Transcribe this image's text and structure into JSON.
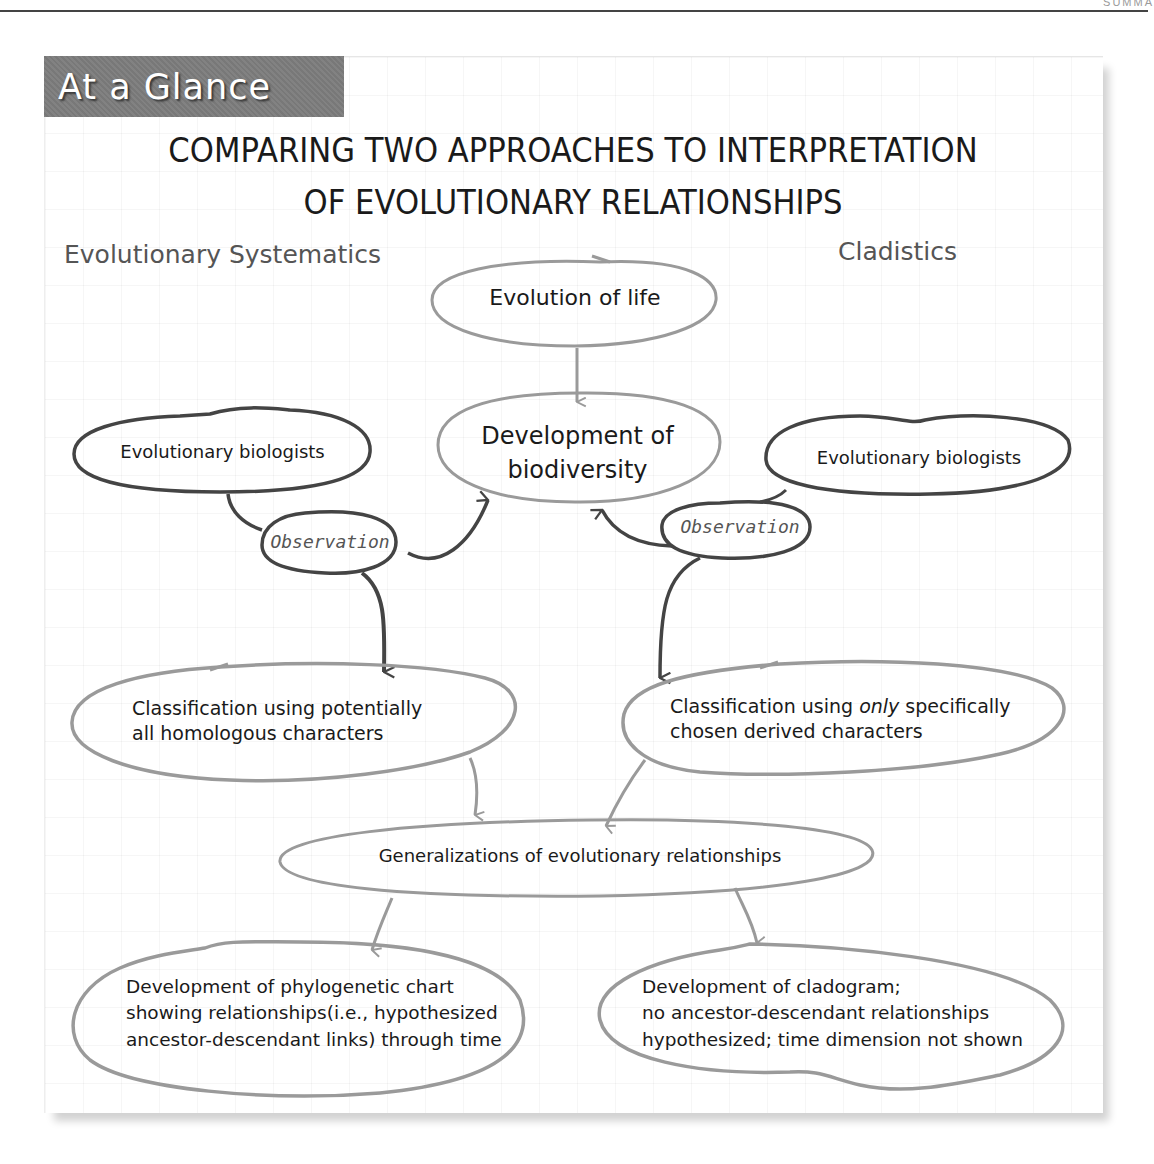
{
  "page": {
    "running_head": "SUMMA"
  },
  "badge": {
    "label": "At a Glance",
    "color": "#7d7d7d"
  },
  "title": {
    "line1": "COMPARING TWO APPROACHES TO INTERPRETATION",
    "line2": "OF EVOLUTIONARY RELATIONSHIPS"
  },
  "columns": {
    "left": "Evolutionary Systematics",
    "right": "Cladistics"
  },
  "nodes": {
    "evolution_of_life": "Evolution of life",
    "development_biodiversity": {
      "line1": "Development of",
      "line2": "biodiversity"
    },
    "biologists_left": "Evolutionary biologists",
    "biologists_right": "Evolutionary biologists",
    "observation_left": "Observation",
    "observation_right": "Observation",
    "classification_left": {
      "line1": "Classification using potentially",
      "line2": "all homologous characters"
    },
    "classification_right": {
      "line1_pre": "Classification using ",
      "line1_em": "only",
      "line1_post": " specifically",
      "line2": "chosen derived characters"
    },
    "generalizations": "Generalizations of evolutionary relationships",
    "phylogenetic_chart": {
      "line1": "Development of phylogenetic chart",
      "line2": "showing relationships(i.e., hypothesized",
      "line3": "ancestor-descendant links) through time"
    },
    "cladogram": {
      "line1": "Development of cladogram;",
      "line2": "no ancestor-descendant relationships",
      "line3": "hypothesized; time dimension not shown"
    }
  },
  "colors": {
    "light_outline": "#9a9a9a",
    "dark_outline": "#4a4a4a",
    "heading_gray": "#555555"
  }
}
